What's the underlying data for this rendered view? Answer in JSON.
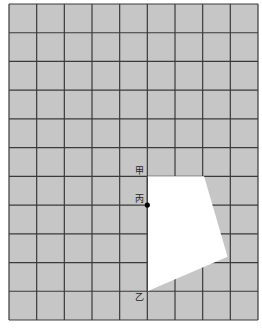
{
  "diagram": {
    "grid": {
      "columns": 9,
      "rows": 11,
      "fill_color": "#c6c6c6",
      "line_color": "#3a3a3a"
    },
    "shape": {
      "fill_color": "#ffffff",
      "vertices_grid": [
        [
          5,
          6
        ],
        [
          7.05,
          6
        ],
        [
          7.9,
          8.8
        ],
        [
          5,
          10
        ]
      ]
    },
    "points": [
      {
        "label": "甲",
        "grid": [
          5,
          6
        ],
        "dot": false
      },
      {
        "label": "丙",
        "grid": [
          5,
          7
        ],
        "dot": true
      },
      {
        "label": "乙",
        "grid": [
          5,
          10
        ],
        "dot": false
      }
    ]
  }
}
